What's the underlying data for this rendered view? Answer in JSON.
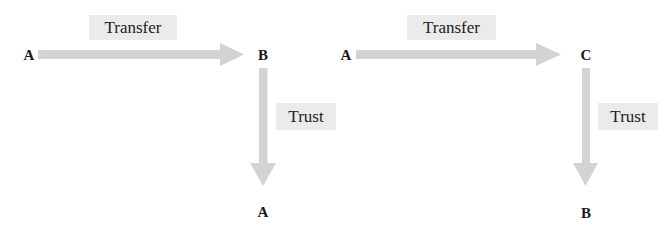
{
  "colors": {
    "arrow": "#d3d3d3",
    "label_bg": "#ebebeb",
    "text": "#1a1a1a"
  },
  "diagrams": [
    {
      "nodes": {
        "source": "A",
        "middle": "B",
        "target": "A"
      },
      "edges": [
        {
          "from": "A",
          "to": "B",
          "label": "Transfer",
          "direction": "right"
        },
        {
          "from": "B",
          "to": "A",
          "label": "Trust",
          "direction": "down"
        }
      ]
    },
    {
      "nodes": {
        "source": "A",
        "middle": "C",
        "target": "B"
      },
      "edges": [
        {
          "from": "A",
          "to": "C",
          "label": "Transfer",
          "direction": "right"
        },
        {
          "from": "C",
          "to": "B",
          "label": "Trust",
          "direction": "down"
        }
      ]
    }
  ]
}
